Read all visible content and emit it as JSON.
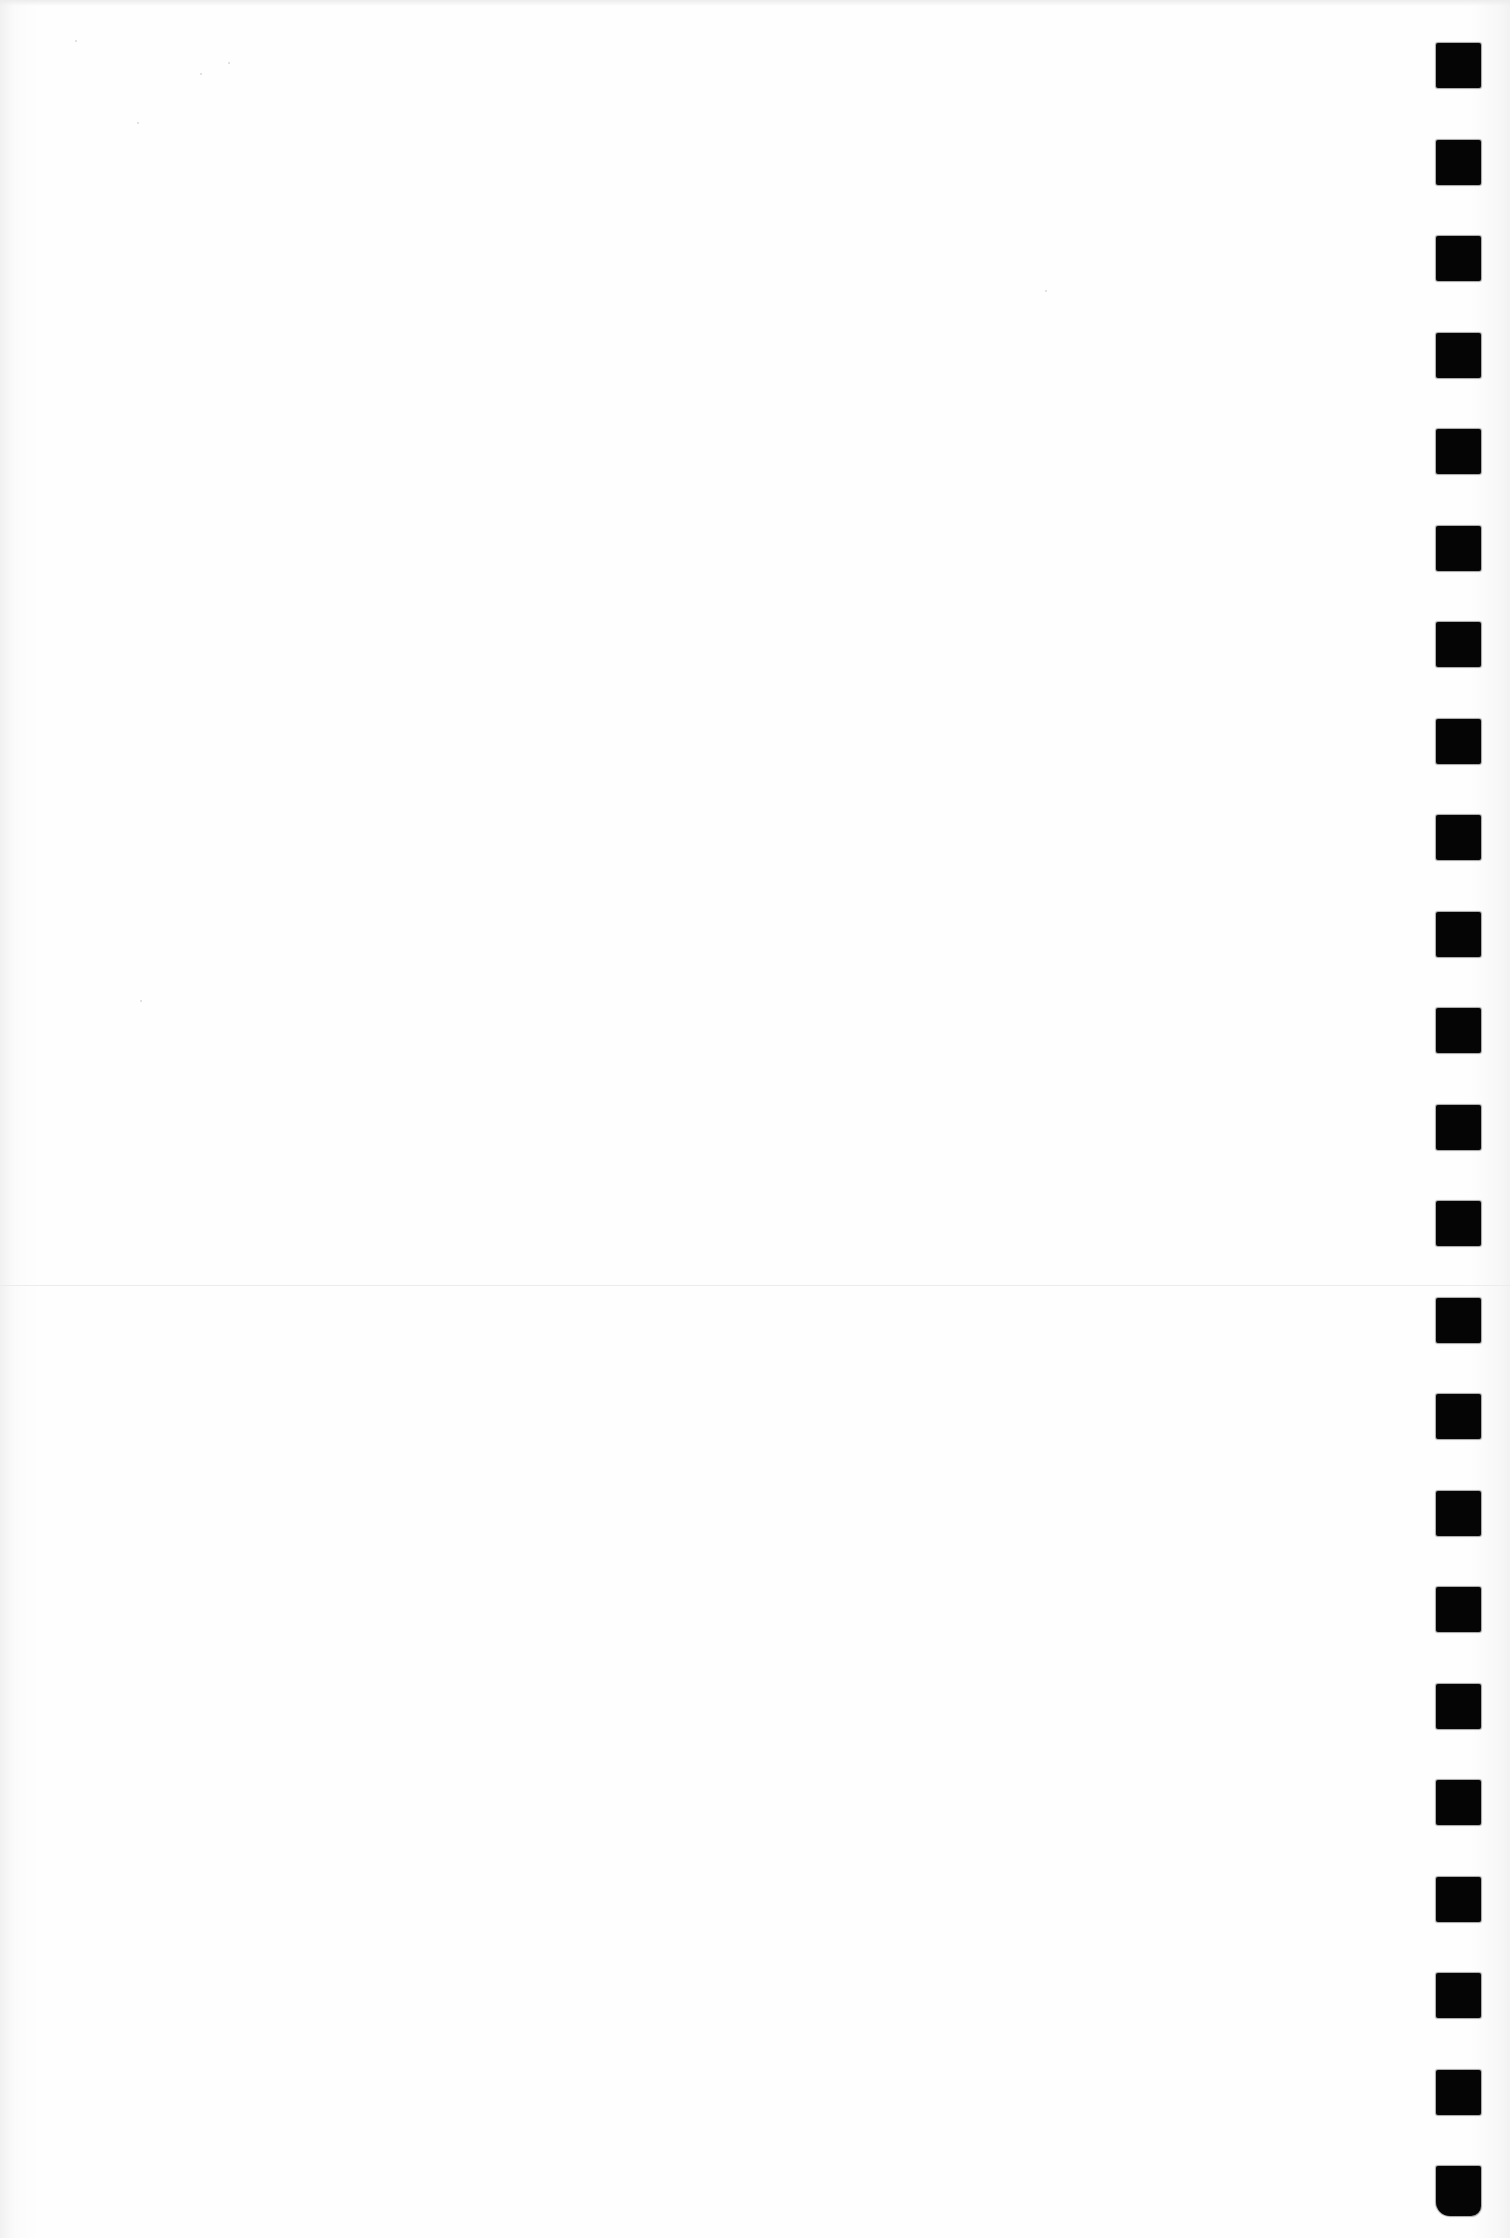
{
  "page": {
    "type": "blank-scanned-page",
    "background_color": "#fdfdfd",
    "text_content": ""
  },
  "binding": {
    "side": "right",
    "hole_count": 23,
    "hole_color": "#050505",
    "hole_size_px": 45,
    "first_hole_top_px": 43,
    "hole_pitch_px": 96.5,
    "left_px": 1436
  },
  "fold_line": {
    "top_px": 1285,
    "color": "#ececec"
  }
}
